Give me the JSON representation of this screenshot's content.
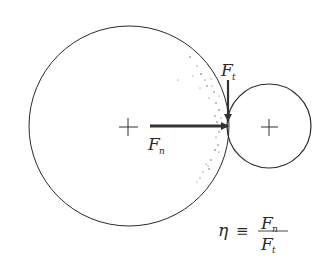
{
  "diagram": {
    "type": "contact-force-schematic",
    "large_circle": {
      "cx": 129,
      "cy": 126,
      "r": 100,
      "center_mark": "+"
    },
    "small_circle": {
      "cx": 269,
      "cy": 126,
      "r": 42,
      "center_mark": "+"
    },
    "contact_point": {
      "x": 229,
      "y": 126
    },
    "forces": [
      {
        "id": "normal",
        "symbol": "F",
        "subscript": "n",
        "direction": "right",
        "from": [
          150,
          126
        ],
        "to": [
          229,
          126
        ]
      },
      {
        "id": "tangential",
        "symbol": "F",
        "subscript": "t",
        "direction": "down",
        "from": [
          229,
          80
        ],
        "to": [
          229,
          122
        ]
      }
    ],
    "labels": {
      "fn_main": "F",
      "fn_sub": "n",
      "ft_main": "F",
      "ft_sub": "t"
    },
    "formula": {
      "lhs": "η",
      "operator": "≡",
      "numerator_main": "F",
      "numerator_sub": "n",
      "denominator_main": "F",
      "denominator_sub": "t"
    },
    "colors": {
      "stroke": "#2a2a2a",
      "arrow": "#333333",
      "speckle": "#555555",
      "background": "#ffffff"
    }
  }
}
